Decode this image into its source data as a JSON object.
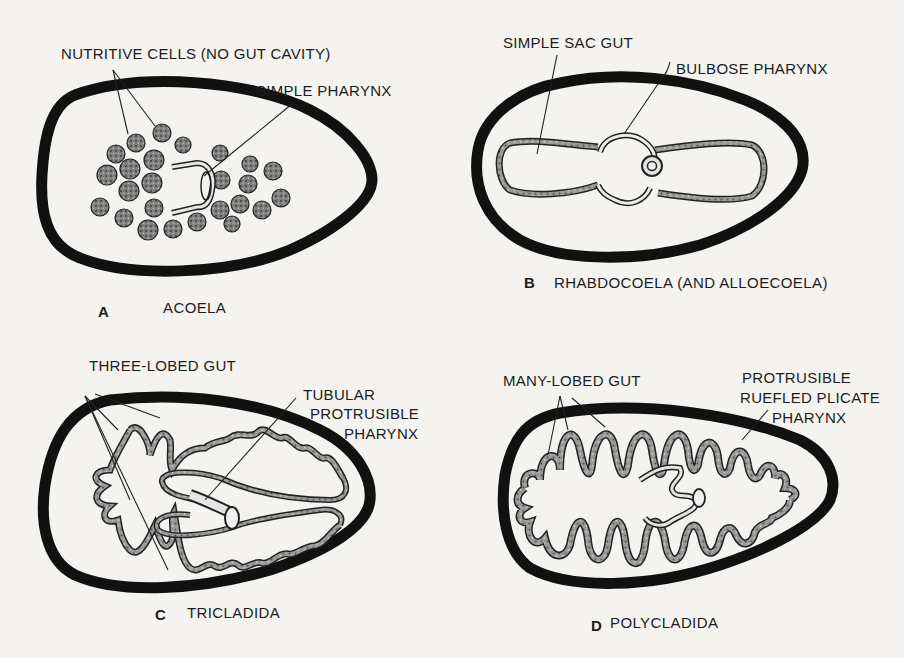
{
  "figure": {
    "colors": {
      "background": "#f4f3ef",
      "ink": "#111111",
      "gut_fill": "#8a8a8a",
      "cell_fill": "#7d7d7d"
    },
    "panels": [
      {
        "letter": "A",
        "caption": "ACOELA",
        "labels": {
          "nutritive_cells": "NUTRITIVE CELLS  (NO GUT CAVITY)",
          "pharynx": "SIMPLE PHARYNX"
        }
      },
      {
        "letter": "B",
        "caption": "RHABDOCOELA (AND ALLOECOELA)",
        "labels": {
          "gut": "SIMPLE SAC GUT",
          "pharynx": "BULBOSE PHARYNX"
        }
      },
      {
        "letter": "C",
        "caption": "TRICLADIDA",
        "labels": {
          "gut": "THREE-LOBED GUT",
          "pharynx_line1": "TUBULAR",
          "pharynx_line2": "PROTRUSIBLE",
          "pharynx_line3": "PHARYNX"
        }
      },
      {
        "letter": "D",
        "caption": "POLYCLADIDA",
        "labels": {
          "gut": "MANY-LOBED GUT",
          "pharynx_line1": "PROTRUSIBLE",
          "pharynx_line2": "RUEFLED PLICATE",
          "pharynx_line3": "PHARYNX"
        }
      }
    ]
  }
}
